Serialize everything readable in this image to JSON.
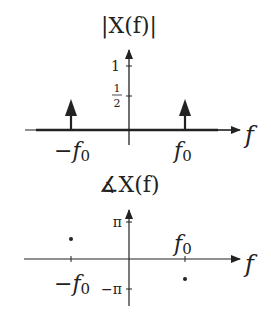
{
  "magnitude_plot": {
    "title": "|X(f)|",
    "x_axis_label": "f",
    "y_ticks": [
      {
        "label": "1",
        "value": 1
      },
      {
        "label_num": "1",
        "label_den": "2",
        "value": 0.5
      }
    ],
    "impulses": [
      {
        "freq_label": "−f",
        "subscript": "0",
        "height": 0.5
      },
      {
        "freq_label": "f",
        "subscript": "0",
        "height": 0.5
      }
    ]
  },
  "phase_plot": {
    "title_symbol": "∡",
    "title": "X(f)",
    "x_axis_label": "f",
    "y_ticks": [
      {
        "label": "π",
        "value": 3.1416
      },
      {
        "label": "−π",
        "value": -3.1416
      }
    ],
    "points": [
      {
        "freq_label": "−f",
        "subscript": "0",
        "phase": "positive"
      },
      {
        "freq_label": "f",
        "subscript": "0",
        "phase": "negative"
      }
    ]
  },
  "colors": {
    "ink": "#222222",
    "background": "#ffffff"
  }
}
